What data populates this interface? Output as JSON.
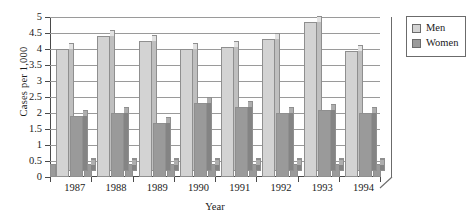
{
  "chart_data": {
    "type": "bar",
    "title": "",
    "xlabel": "Year",
    "ylabel": "Cases per 1,000",
    "categories": [
      "1987",
      "1988",
      "1989",
      "1990",
      "1991",
      "1992",
      "1993",
      "1994"
    ],
    "series": [
      {
        "name": "Men",
        "color": "#d3d3d3",
        "values": [
          4.0,
          4.4,
          4.25,
          4.0,
          4.05,
          4.3,
          4.85,
          3.95
        ]
      },
      {
        "name": "Women",
        "color": "#9a9a9a",
        "values": [
          1.9,
          2.0,
          1.7,
          2.3,
          2.2,
          2.0,
          2.1,
          2.0
        ]
      }
    ],
    "ylim": [
      0,
      5
    ],
    "yticks": [
      "0",
      "0.5",
      "1",
      "1.5",
      "2",
      "2.5",
      "3",
      "3.5",
      "4",
      "4.5",
      "5"
    ],
    "ytick_values": [
      0,
      0.5,
      1,
      1.5,
      2,
      2.5,
      3,
      3.5,
      4,
      4.5,
      5
    ],
    "grid": true,
    "legend_position": "right",
    "style": "3d-column"
  },
  "legend": {
    "items": [
      {
        "label": "Men",
        "swatch": "#d3d3d3"
      },
      {
        "label": "Women",
        "swatch": "#9a9a9a"
      }
    ]
  }
}
